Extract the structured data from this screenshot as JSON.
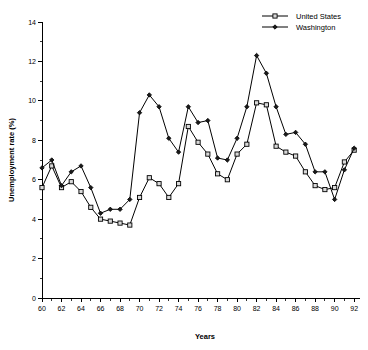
{
  "chart_data": {
    "type": "line",
    "title": "",
    "xlabel": "Years",
    "ylabel": "Unemployment rate (%)",
    "xlim": [
      60,
      92.6
    ],
    "ylim": [
      0,
      14
    ],
    "ytick_values": [
      0,
      2,
      4,
      6,
      8,
      10,
      12,
      14
    ],
    "ytick_labels": [
      "0",
      "2",
      "4",
      "6",
      "8",
      "10",
      "12",
      "14"
    ],
    "xtick_values": [
      60,
      62,
      64,
      66,
      68,
      70,
      72,
      74,
      76,
      78,
      80,
      82,
      84,
      86,
      88,
      90,
      92
    ],
    "xtick_labels": [
      "60",
      "62",
      "64",
      "66",
      "68",
      "70",
      "72",
      "74",
      "76",
      "78",
      "80",
      "82",
      "84",
      "86",
      "88",
      "90",
      "92"
    ],
    "x_minor_step": 1,
    "grid": false,
    "legend_position": "top-right",
    "x": [
      60,
      61,
      62,
      63,
      64,
      65,
      66,
      67,
      68,
      69,
      70,
      71,
      72,
      73,
      74,
      75,
      76,
      77,
      78,
      79,
      80,
      81,
      82,
      83,
      84,
      85,
      86,
      87,
      88,
      89,
      90,
      91,
      92
    ],
    "series": [
      {
        "name": "United States",
        "marker": "open-square",
        "values": [
          5.6,
          6.7,
          5.6,
          5.9,
          5.4,
          4.6,
          4.0,
          3.9,
          3.8,
          3.7,
          5.1,
          6.1,
          5.8,
          5.1,
          5.8,
          8.7,
          7.9,
          7.3,
          6.3,
          6.0,
          7.3,
          7.8,
          9.9,
          9.8,
          7.7,
          7.4,
          7.2,
          6.4,
          5.7,
          5.5,
          5.6,
          6.9,
          7.5
        ]
      },
      {
        "name": "Washington",
        "marker": "filled-diamond",
        "values": [
          6.6,
          7.0,
          5.7,
          6.4,
          6.7,
          5.6,
          4.3,
          4.5,
          4.5,
          5.0,
          9.4,
          10.3,
          9.7,
          8.1,
          7.4,
          9.7,
          8.9,
          9.0,
          7.1,
          7.0,
          8.1,
          9.7,
          12.3,
          11.4,
          9.7,
          8.3,
          8.4,
          7.8,
          6.4,
          6.4,
          5.0,
          6.5,
          7.6
        ]
      }
    ]
  },
  "legend": {
    "items": [
      {
        "label": "United States"
      },
      {
        "label": "Washington"
      }
    ]
  }
}
